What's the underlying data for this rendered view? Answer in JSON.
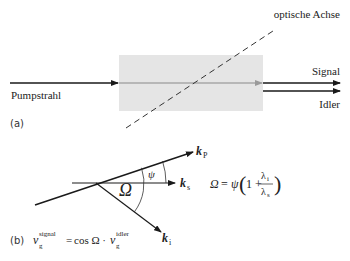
{
  "panel_a": {
    "label": "(a)",
    "pump_label": "Pumpstrahl",
    "signal_label": "Signal",
    "idler_label": "Idler",
    "axis_label": "optische Achse",
    "colors": {
      "crystal_fill": "#e5e5e5",
      "beam_inside": "#8a8a8a",
      "line": "#1a1a1a",
      "dash": "#333333"
    }
  },
  "panel_b": {
    "label": "(b)",
    "vectors": {
      "kp": {
        "symbol": "k",
        "sub": "P"
      },
      "ks": {
        "symbol": "k",
        "sub": "s"
      },
      "ki": {
        "symbol": "k",
        "sub": "i"
      }
    },
    "angle_labels": {
      "psi": "ψ",
      "omega": "Ω"
    },
    "formula_omega": {
      "lhs": "Ω",
      "eq": "=",
      "psi": "ψ",
      "one_plus": "1 +",
      "num": "λ",
      "num_sub": "i",
      "den": "λ",
      "den_sub": "s",
      "open_paren": "(",
      "close_paren": ")"
    },
    "formula_velocity": {
      "v1": "v",
      "v1_sup": "signal",
      "v1_sub": "g",
      "eq": "=",
      "mid": "cos Ω ·",
      "v2": "v",
      "v2_sup": "idler",
      "v2_sub": "g"
    }
  }
}
